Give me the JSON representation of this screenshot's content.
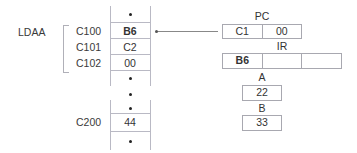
{
  "instruction_label": "LDAA",
  "memory": {
    "rows": [
      {
        "address": "C100",
        "value": "B6",
        "bold": true
      },
      {
        "address": "C101",
        "value": "C2",
        "bold": false
      },
      {
        "address": "C102",
        "value": "00",
        "bold": false
      },
      {
        "address": "C200",
        "value": "44",
        "bold": false
      }
    ],
    "ellipsis": "•"
  },
  "registers": {
    "pc": {
      "label": "PC",
      "cells": [
        "C1",
        "00"
      ]
    },
    "ir": {
      "label": "IR",
      "cells": [
        "B6",
        "",
        ""
      ]
    },
    "a": {
      "label": "A",
      "value": "22"
    },
    "b": {
      "label": "B",
      "value": "33"
    }
  },
  "colors": {
    "line": "#b9b9c4",
    "text": "#333333",
    "background": "#ffffff"
  }
}
